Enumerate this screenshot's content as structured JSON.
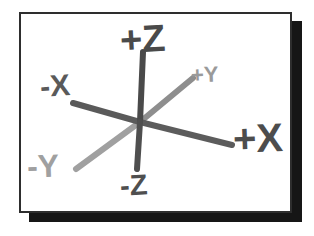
{
  "figure": {
    "title_alt": "3D coordinate axes diagram",
    "frame": {
      "background_color": "#ffffff",
      "border_color": "#2e2e2e",
      "shadow_color": "#161616"
    },
    "origin": {
      "x": 119,
      "y": 108
    },
    "axes": [
      {
        "id": "plus-z",
        "label": "+Z",
        "color": "#4a4a4a",
        "from": {
          "x": 119,
          "y": 108
        },
        "to": {
          "x": 122,
          "y": 38
        },
        "stroke_width": 6
      },
      {
        "id": "minus-z",
        "label": "-Z",
        "color": "#4f4f4f",
        "from": {
          "x": 119,
          "y": 108
        },
        "to": {
          "x": 116,
          "y": 155
        },
        "stroke_width": 6
      },
      {
        "id": "plus-x",
        "label": "+X",
        "color": "#5c5c5c",
        "from": {
          "x": 119,
          "y": 108
        },
        "to": {
          "x": 211,
          "y": 131
        },
        "stroke_width": 6
      },
      {
        "id": "minus-x",
        "label": "-X",
        "color": "#5a5a5a",
        "from": {
          "x": 119,
          "y": 108
        },
        "to": {
          "x": 52,
          "y": 89
        },
        "stroke_width": 6
      },
      {
        "id": "plus-y",
        "label": "+Y",
        "color": "#8e8e8e",
        "from": {
          "x": 119,
          "y": 108
        },
        "to": {
          "x": 172,
          "y": 64
        },
        "stroke_width": 6
      },
      {
        "id": "minus-y",
        "label": "-Y",
        "color": "#a0a0a0",
        "from": {
          "x": 119,
          "y": 108
        },
        "to": {
          "x": 55,
          "y": 155
        },
        "stroke_width": 6
      }
    ]
  },
  "labels": {
    "plus_z": "+Z",
    "minus_z": "-Z",
    "plus_x": "+X",
    "minus_x": "-X",
    "plus_y": "+Y",
    "minus_y": "-Y"
  }
}
